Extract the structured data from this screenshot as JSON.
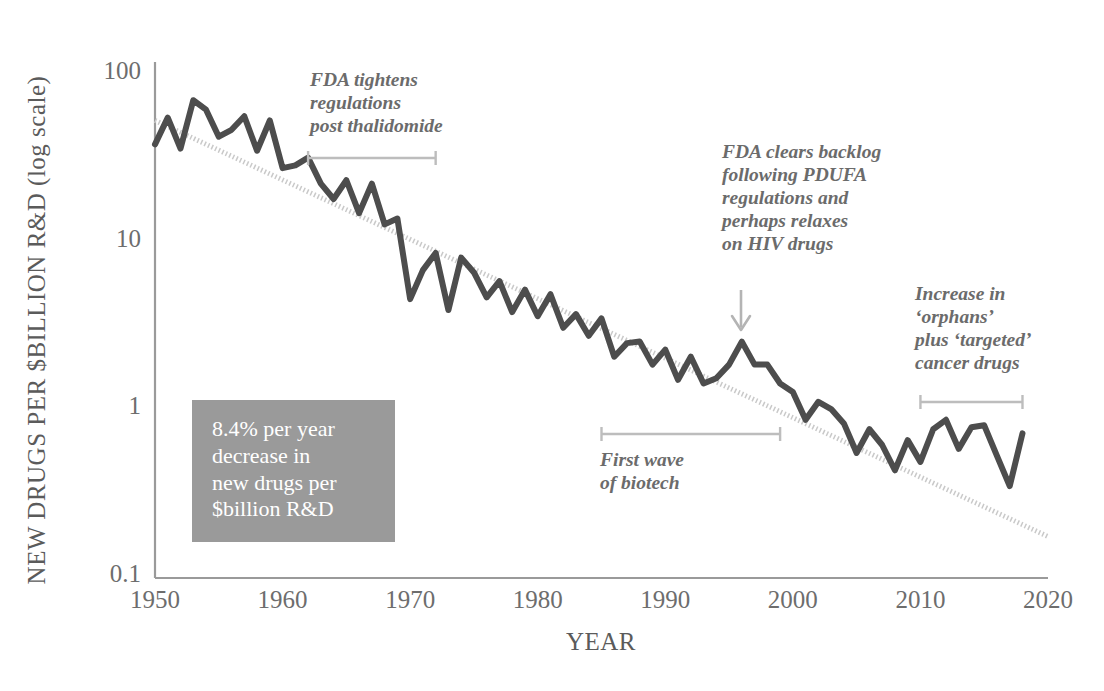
{
  "figure": {
    "y_axis_title": "NEW DRUGS PER $BILLION R&D (log scale)",
    "x_axis_title": "YEAR",
    "line_color": "#4d4d4d",
    "trend_color": "#c9c9c9",
    "axis_color": "#9a9a9a",
    "annotation_color": "#6b6b6b",
    "callout_bg": "#9a9a9a"
  },
  "callout": {
    "text": "8.4% per year\ndecrease in\nnew drugs per\n$billion R&D"
  },
  "annotations": [
    {
      "name": "fda-thalidomide",
      "text": "FDA tightens\nregulations\npost thalidomide",
      "bracket_start_year": 1962,
      "bracket_end_year": 1972
    },
    {
      "name": "pdufa-backlog",
      "text": "FDA clears backlog\nfollowing PDUFA\nregulations and\nperhaps relaxes\non HIV drugs",
      "arrow_target_year": 1996
    },
    {
      "name": "first-wave-biotech",
      "text": "First wave\nof biotech",
      "bracket_start_year": 1985,
      "bracket_end_year": 1999
    },
    {
      "name": "orphans-targeted",
      "text": "Increase in\n‘orphans’\nplus ‘targeted’\ncancer drugs",
      "bracket_start_year": 2010,
      "bracket_end_year": 2018
    }
  ],
  "chart_data": {
    "type": "line",
    "title": "",
    "xlabel": "YEAR",
    "ylabel": "NEW DRUGS PER $BILLION R&D (log scale)",
    "yscale": "log",
    "ylim": [
      0.1,
      100
    ],
    "xlim": [
      1950,
      2020
    ],
    "ytick_labels": [
      "100",
      "10",
      "1",
      "0.1"
    ],
    "ytick_values": [
      100,
      10,
      1,
      0.1
    ],
    "xtick_labels": [
      "1950",
      "1960",
      "1970",
      "1980",
      "1990",
      "2000",
      "2010",
      "2020"
    ],
    "xtick_values": [
      1950,
      1960,
      1970,
      1980,
      1990,
      2000,
      2010,
      2020
    ],
    "grid": false,
    "legend": "none",
    "series": [
      {
        "name": "New drugs per $billion R&D",
        "style": "solid",
        "x": [
          1950,
          1951,
          1952,
          1953,
          1954,
          1955,
          1956,
          1957,
          1958,
          1959,
          1960,
          1961,
          1962,
          1963,
          1964,
          1965,
          1966,
          1967,
          1968,
          1969,
          1970,
          1971,
          1972,
          1973,
          1974,
          1975,
          1976,
          1977,
          1978,
          1979,
          1980,
          1981,
          1982,
          1983,
          1984,
          1985,
          1986,
          1987,
          1988,
          1989,
          1990,
          1991,
          1992,
          1993,
          1994,
          1995,
          1996,
          1997,
          1998,
          1999,
          2000,
          2001,
          2002,
          2003,
          2004,
          2005,
          2006,
          2007,
          2008,
          2009,
          2010,
          2011,
          2012,
          2013,
          2014,
          2015,
          2016,
          2017,
          2018
        ],
        "y": [
          36,
          52,
          34,
          66,
          58,
          40,
          44,
          53,
          33,
          50,
          26,
          27,
          30,
          21,
          17,
          22,
          14,
          21,
          12,
          13,
          4.3,
          6.4,
          8.1,
          3.7,
          7.6,
          6.2,
          4.4,
          5.5,
          3.6,
          4.9,
          3.4,
          4.6,
          2.9,
          3.5,
          2.6,
          3.3,
          1.95,
          2.35,
          2.4,
          1.75,
          2.15,
          1.42,
          1.95,
          1.35,
          1.45,
          1.75,
          2.4,
          1.75,
          1.75,
          1.35,
          1.2,
          0.82,
          1.05,
          0.95,
          0.78,
          0.52,
          0.72,
          0.58,
          0.41,
          0.62,
          0.46,
          0.72,
          0.82,
          0.55,
          0.74,
          0.76,
          0.5,
          0.33,
          0.68
        ]
      },
      {
        "name": "Exponential trend (8.4% per year decrease)",
        "style": "dotted",
        "x": [
          1950,
          2020
        ],
        "y": [
          50,
          0.165
        ]
      }
    ]
  }
}
